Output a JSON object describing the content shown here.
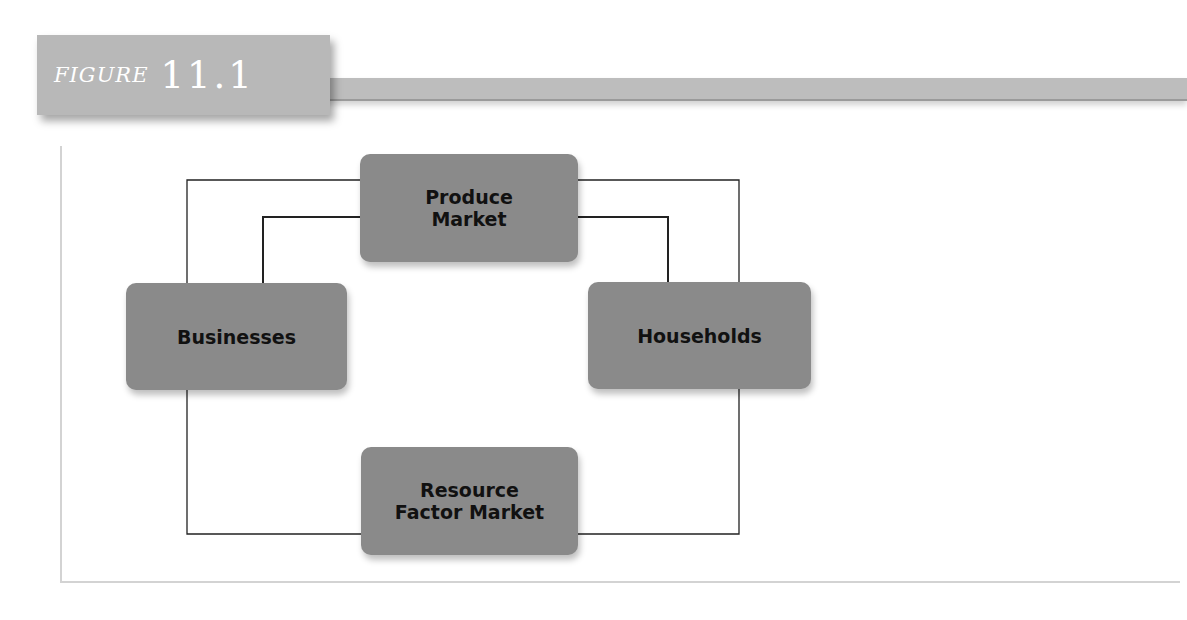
{
  "figure": {
    "label_word": "FIGURE",
    "label_number": "11.1"
  },
  "diagram": {
    "type": "circular-flow",
    "nodes": [
      {
        "id": "produce",
        "label": "Produce\nMarket"
      },
      {
        "id": "businesses",
        "label": "Businesses"
      },
      {
        "id": "households",
        "label": "Households"
      },
      {
        "id": "resource",
        "label": "Resource\nFactor Market"
      }
    ],
    "edges": [
      {
        "from": "businesses",
        "to": "produce",
        "path": "outer"
      },
      {
        "from": "businesses",
        "to": "produce",
        "path": "inner"
      },
      {
        "from": "produce",
        "to": "households",
        "path": "outer"
      },
      {
        "from": "produce",
        "to": "households",
        "path": "inner"
      },
      {
        "from": "businesses",
        "to": "resource",
        "path": "outer"
      },
      {
        "from": "resource",
        "to": "households",
        "path": "outer"
      }
    ],
    "colors": {
      "node_fill": "#8a8a8a",
      "line": "#222222",
      "figure_tab": "#b8b8b8"
    }
  }
}
